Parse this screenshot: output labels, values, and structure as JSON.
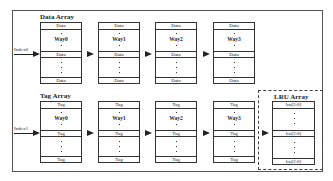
{
  "diagram": {
    "data_array": {
      "label": "Data Array",
      "index_label": "Index0",
      "blocks": [
        {
          "way": "Way0",
          "row_label": "Data"
        },
        {
          "way": "Way1",
          "row_label": "Data"
        },
        {
          "way": "Way2",
          "row_label": "Data"
        },
        {
          "way": "Way3",
          "row_label": "Data"
        }
      ]
    },
    "tag_array": {
      "label": "Tag Array",
      "index_label": "Index1",
      "blocks": [
        {
          "way": "Way0",
          "row_label": "Tag"
        },
        {
          "way": "Way1",
          "row_label": "Tag"
        },
        {
          "way": "Way2",
          "row_label": "Tag"
        },
        {
          "way": "Way3",
          "row_label": "Tag"
        }
      ]
    },
    "lru_array": {
      "label": "LRU Array",
      "row_label": "lru[2:0]"
    }
  }
}
